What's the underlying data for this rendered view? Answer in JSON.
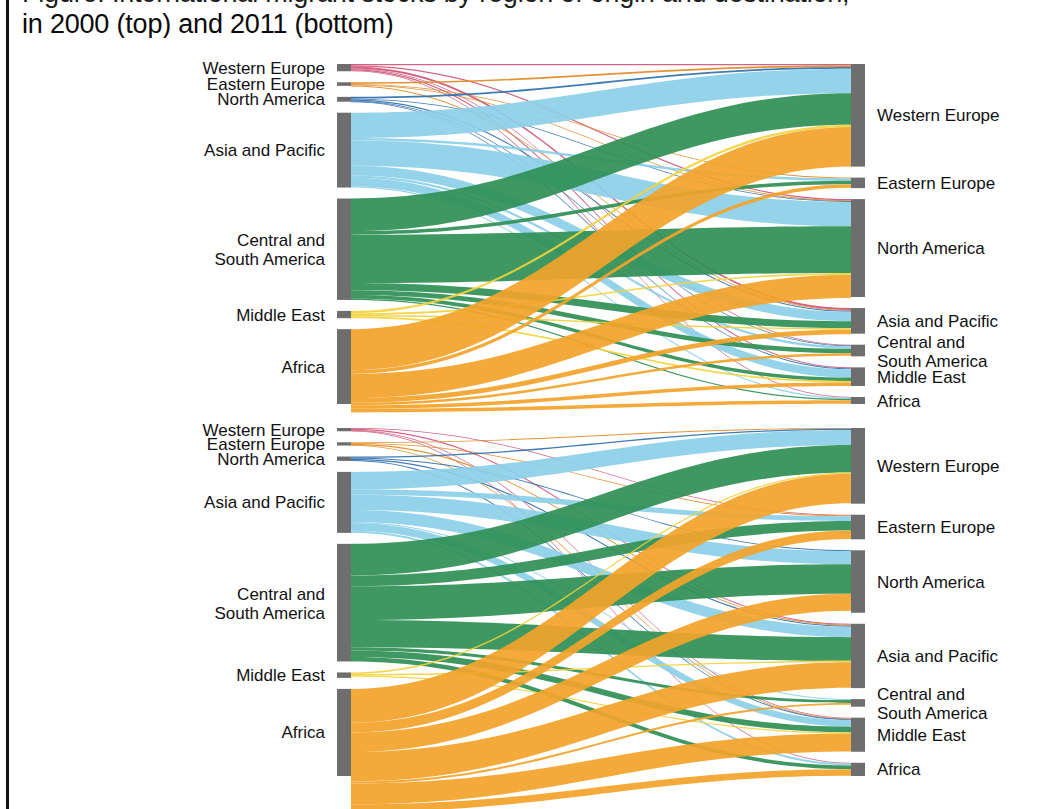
{
  "caption": {
    "line_cut": "Figure: International migrant stocks by region of origin and destination,",
    "line_visible": "in 2000 (top) and 2011 (bottom)"
  },
  "palette": {
    "node": "#6e6e6e",
    "western_europe": "#cf5578",
    "eastern_europe": "#e08a26",
    "north_america": "#2f6fad",
    "asia_and_pacific": "#8ccfe8",
    "central_and_south_america": "#2f8f55",
    "middle_east": "#f2d33c",
    "africa": "#f2a32a",
    "background": "#ffffff",
    "text": "#111111"
  },
  "regions": [
    {
      "key": "western_europe",
      "label": "Western Europe",
      "color": "#cf5578"
    },
    {
      "key": "eastern_europe",
      "label": "Eastern Europe",
      "color": "#e08a26"
    },
    {
      "key": "north_america",
      "label": "North America",
      "color": "#2f6fad"
    },
    {
      "key": "asia_and_pacific",
      "label": "Asia and Pacific",
      "color": "#8ccfe8"
    },
    {
      "key": "central_and_south_america",
      "label": "Central and\nSouth America",
      "color": "#2f8f55"
    },
    {
      "key": "middle_east",
      "label": "Middle East",
      "color": "#f2d33c"
    },
    {
      "key": "africa",
      "label": "Africa",
      "color": "#f2a32a"
    }
  ],
  "chart_data": [
    {
      "id": "sankey-2000",
      "type": "sankey",
      "title": "2000 (top)",
      "legend_position": "none",
      "grid": false,
      "left_axis_label": "Region of origin",
      "right_axis_label": "Region of destination",
      "left_nodes": [
        {
          "key": "western_europe",
          "label": "Western Europe",
          "value": 6
        },
        {
          "key": "eastern_europe",
          "label": "Eastern Europe",
          "value": 3
        },
        {
          "key": "north_america",
          "label": "North America",
          "value": 4
        },
        {
          "key": "asia_and_pacific",
          "label": "Asia and Pacific",
          "value": 62
        },
        {
          "key": "central_and_south_america",
          "label": "Central and\nSouth America",
          "value": 84
        },
        {
          "key": "middle_east",
          "label": "Middle East",
          "value": 6
        },
        {
          "key": "africa",
          "label": "Africa",
          "value": 62
        }
      ],
      "right_nodes": [
        {
          "key": "western_europe",
          "label": "Western Europe",
          "value": 88
        },
        {
          "key": "eastern_europe",
          "label": "Eastern Europe",
          "value": 9
        },
        {
          "key": "north_america",
          "label": "North America",
          "value": 84
        },
        {
          "key": "asia_and_pacific",
          "label": "Asia and Pacific",
          "value": 22
        },
        {
          "key": "central_and_south_america",
          "label": "Central and\nSouth America",
          "value": 10
        },
        {
          "key": "middle_east",
          "label": "Middle East",
          "value": 16
        },
        {
          "key": "africa",
          "label": "Africa",
          "value": 6
        }
      ],
      "flows": [
        {
          "source": "western_europe",
          "target": "western_europe",
          "value": 1.1
        },
        {
          "source": "western_europe",
          "target": "north_america",
          "value": 1.0
        },
        {
          "source": "western_europe",
          "target": "asia_and_pacific",
          "value": 1.6
        },
        {
          "source": "western_europe",
          "target": "central_and_south_america",
          "value": 0.7
        },
        {
          "source": "western_europe",
          "target": "middle_east",
          "value": 1.0
        },
        {
          "source": "western_europe",
          "target": "africa",
          "value": 0.6
        },
        {
          "source": "eastern_europe",
          "target": "western_europe",
          "value": 1.4
        },
        {
          "source": "eastern_europe",
          "target": "eastern_europe",
          "value": 0.5
        },
        {
          "source": "eastern_europe",
          "target": "north_america",
          "value": 0.7
        },
        {
          "source": "eastern_europe",
          "target": "asia_and_pacific",
          "value": 0.4
        },
        {
          "source": "north_america",
          "target": "western_europe",
          "value": 1.5
        },
        {
          "source": "north_america",
          "target": "north_america",
          "value": 0.6
        },
        {
          "source": "north_america",
          "target": "asia_and_pacific",
          "value": 1.0
        },
        {
          "source": "north_america",
          "target": "central_and_south_america",
          "value": 0.5
        },
        {
          "source": "north_america",
          "target": "middle_east",
          "value": 0.4
        },
        {
          "source": "asia_and_pacific",
          "target": "western_europe",
          "value": 21
        },
        {
          "source": "asia_and_pacific",
          "target": "eastern_europe",
          "value": 2
        },
        {
          "source": "asia_and_pacific",
          "target": "north_america",
          "value": 21
        },
        {
          "source": "asia_and_pacific",
          "target": "asia_and_pacific",
          "value": 8
        },
        {
          "source": "asia_and_pacific",
          "target": "central_and_south_america",
          "value": 2
        },
        {
          "source": "asia_and_pacific",
          "target": "middle_east",
          "value": 7
        },
        {
          "source": "asia_and_pacific",
          "target": "africa",
          "value": 1
        },
        {
          "source": "central_and_south_america",
          "target": "western_europe",
          "value": 27
        },
        {
          "source": "central_and_south_america",
          "target": "eastern_europe",
          "value": 3
        },
        {
          "source": "central_and_south_america",
          "target": "north_america",
          "value": 40
        },
        {
          "source": "central_and_south_america",
          "target": "asia_and_pacific",
          "value": 6
        },
        {
          "source": "central_and_south_america",
          "target": "central_and_south_america",
          "value": 4
        },
        {
          "source": "central_and_south_america",
          "target": "middle_east",
          "value": 3
        },
        {
          "source": "central_and_south_america",
          "target": "africa",
          "value": 1
        },
        {
          "source": "middle_east",
          "target": "western_europe",
          "value": 2.0
        },
        {
          "source": "middle_east",
          "target": "north_america",
          "value": 1.4
        },
        {
          "source": "middle_east",
          "target": "asia_and_pacific",
          "value": 1.2
        },
        {
          "source": "middle_east",
          "target": "middle_east",
          "value": 1.4
        },
        {
          "source": "africa",
          "target": "western_europe",
          "value": 34
        },
        {
          "source": "africa",
          "target": "eastern_europe",
          "value": 3
        },
        {
          "source": "africa",
          "target": "north_america",
          "value": 20
        },
        {
          "source": "africa",
          "target": "asia_and_pacific",
          "value": 4
        },
        {
          "source": "africa",
          "target": "central_and_south_america",
          "value": 2
        },
        {
          "source": "africa",
          "target": "middle_east",
          "value": 3
        },
        {
          "source": "africa",
          "target": "africa",
          "value": 3
        }
      ]
    },
    {
      "id": "sankey-2011",
      "type": "sankey",
      "title": "2011 (bottom)",
      "legend_position": "none",
      "grid": false,
      "left_axis_label": "Region of origin",
      "right_axis_label": "Region of destination",
      "left_nodes": [
        {
          "key": "western_europe",
          "label": "Western Europe",
          "value": 3
        },
        {
          "key": "eastern_europe",
          "label": "Eastern Europe",
          "value": 3
        },
        {
          "key": "north_america",
          "label": "North America",
          "value": 4
        },
        {
          "key": "asia_and_pacific",
          "label": "Asia and Pacific",
          "value": 56
        },
        {
          "key": "central_and_south_america",
          "label": "Central and\nSouth America",
          "value": 108
        },
        {
          "key": "middle_east",
          "label": "Middle East",
          "value": 5
        },
        {
          "key": "africa",
          "label": "Africa",
          "value": 80
        }
      ],
      "right_nodes": [
        {
          "key": "western_europe",
          "label": "Western Europe",
          "value": 80
        },
        {
          "key": "eastern_europe",
          "label": "Eastern Europe",
          "value": 26
        },
        {
          "key": "north_america",
          "label": "North America",
          "value": 66
        },
        {
          "key": "asia_and_pacific",
          "label": "Asia and Pacific",
          "value": 68
        },
        {
          "key": "central_and_south_america",
          "label": "Central and\nSouth America",
          "value": 8
        },
        {
          "key": "middle_east",
          "label": "Middle East",
          "value": 36
        },
        {
          "key": "africa",
          "label": "Africa",
          "value": 14
        }
      ],
      "flows": [
        {
          "source": "western_europe",
          "target": "eastern_europe",
          "value": 0.6
        },
        {
          "source": "western_europe",
          "target": "asia_and_pacific",
          "value": 1.0
        },
        {
          "source": "western_europe",
          "target": "middle_east",
          "value": 0.8
        },
        {
          "source": "western_europe",
          "target": "africa",
          "value": 0.6
        },
        {
          "source": "eastern_europe",
          "target": "western_europe",
          "value": 0.7
        },
        {
          "source": "eastern_europe",
          "target": "eastern_europe",
          "value": 0.6
        },
        {
          "source": "eastern_europe",
          "target": "asia_and_pacific",
          "value": 1.0
        },
        {
          "source": "eastern_europe",
          "target": "middle_east",
          "value": 0.7
        },
        {
          "source": "north_america",
          "target": "western_europe",
          "value": 1.2
        },
        {
          "source": "north_america",
          "target": "north_america",
          "value": 0.8
        },
        {
          "source": "north_america",
          "target": "asia_and_pacific",
          "value": 1.2
        },
        {
          "source": "north_america",
          "target": "middle_east",
          "value": 0.8
        },
        {
          "source": "asia_and_pacific",
          "target": "western_europe",
          "value": 16
        },
        {
          "source": "asia_and_pacific",
          "target": "eastern_europe",
          "value": 5
        },
        {
          "source": "asia_and_pacific",
          "target": "north_america",
          "value": 14
        },
        {
          "source": "asia_and_pacific",
          "target": "asia_and_pacific",
          "value": 11
        },
        {
          "source": "asia_and_pacific",
          "target": "central_and_south_america",
          "value": 1
        },
        {
          "source": "asia_and_pacific",
          "target": "middle_east",
          "value": 7
        },
        {
          "source": "asia_and_pacific",
          "target": "africa",
          "value": 2
        },
        {
          "source": "central_and_south_america",
          "target": "western_europe",
          "value": 29
        },
        {
          "source": "central_and_south_america",
          "target": "eastern_europe",
          "value": 10
        },
        {
          "source": "central_and_south_america",
          "target": "north_america",
          "value": 31
        },
        {
          "source": "central_and_south_america",
          "target": "asia_and_pacific",
          "value": 25
        },
        {
          "source": "central_and_south_america",
          "target": "central_and_south_america",
          "value": 3
        },
        {
          "source": "central_and_south_america",
          "target": "middle_east",
          "value": 6
        },
        {
          "source": "central_and_south_america",
          "target": "africa",
          "value": 4
        },
        {
          "source": "middle_east",
          "target": "western_europe",
          "value": 1.4
        },
        {
          "source": "middle_east",
          "target": "asia_and_pacific",
          "value": 1.4
        },
        {
          "source": "middle_east",
          "target": "middle_east",
          "value": 1.2
        },
        {
          "source": "africa",
          "target": "western_europe",
          "value": 31
        },
        {
          "source": "africa",
          "target": "eastern_europe",
          "value": 9
        },
        {
          "source": "africa",
          "target": "north_america",
          "value": 18
        },
        {
          "source": "africa",
          "target": "asia_and_pacific",
          "value": 27
        },
        {
          "source": "africa",
          "target": "central_and_south_america",
          "value": 2
        },
        {
          "source": "africa",
          "target": "middle_east",
          "value": 19
        },
        {
          "source": "africa",
          "target": "africa",
          "value": 7
        }
      ]
    }
  ]
}
